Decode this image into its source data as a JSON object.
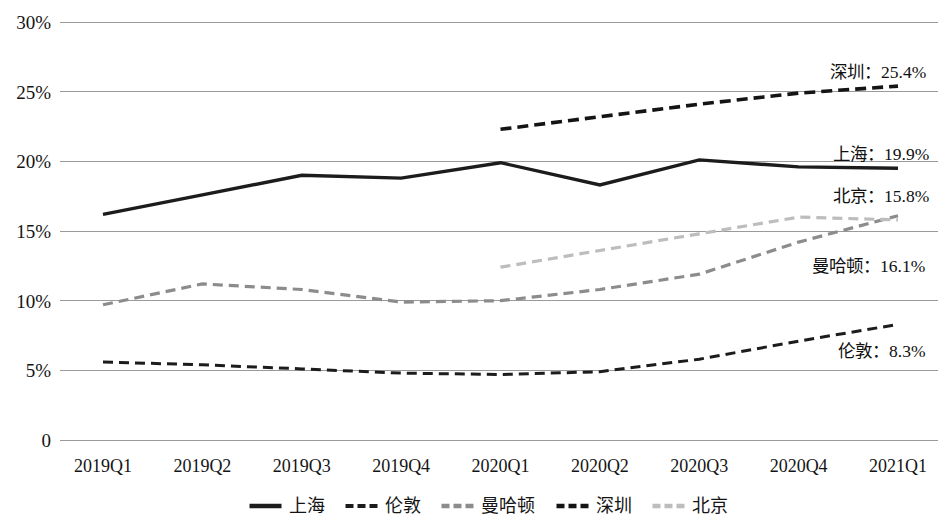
{
  "chart_data": {
    "type": "line",
    "title": "",
    "subtitle": "",
    "xlabel": "",
    "ylabel": "",
    "grid": true,
    "legend_position": "bottom",
    "ylim": [
      0,
      30
    ],
    "ytick_labels": [
      "30%",
      "25%",
      "20%",
      "15%",
      "10%",
      "5%",
      "0"
    ],
    "ytick_values": [
      30,
      25,
      20,
      15,
      10,
      5,
      0
    ],
    "categories": [
      "2019Q1",
      "2019Q2",
      "2019Q3",
      "2019Q4",
      "2020Q1",
      "2020Q2",
      "2020Q3",
      "2020Q4",
      "2021Q1"
    ],
    "series": [
      {
        "name": "上海",
        "legend_label": "上海",
        "style": "solid",
        "color": "#1c1c1c",
        "width": 3.4,
        "values": [
          16.2,
          17.6,
          19.0,
          18.8,
          19.9,
          18.3,
          20.1,
          19.6,
          19.5
        ],
        "annotation": "上海：19.9%",
        "annotation_value": "19.9%"
      },
      {
        "name": "伦敦",
        "legend_label": "伦敦",
        "style": "dashed",
        "color": "#1c1c1c",
        "width": 3.0,
        "values": [
          5.6,
          5.4,
          5.1,
          4.8,
          4.7,
          4.9,
          5.8,
          7.1,
          8.3
        ],
        "annotation": "伦敦：8.3%",
        "annotation_value": "8.3%"
      },
      {
        "name": "曼哈顿",
        "legend_label": "曼哈顿",
        "style": "dashed",
        "color": "#8c8c8c",
        "width": 3.2,
        "values": [
          9.7,
          11.2,
          10.8,
          9.9,
          10.0,
          10.8,
          11.9,
          14.2,
          16.1
        ],
        "annotation": "曼哈顿：16.1%",
        "annotation_value": "16.1%"
      },
      {
        "name": "深圳",
        "legend_label": "深圳",
        "style": "dashed",
        "color": "#141414",
        "width": 3.6,
        "values": [
          null,
          null,
          null,
          null,
          22.3,
          23.2,
          24.1,
          24.9,
          25.4
        ],
        "annotation": "深圳：25.4%",
        "annotation_value": "25.4%"
      },
      {
        "name": "北京",
        "legend_label": "北京",
        "style": "dashed",
        "color": "#bdbdbd",
        "width": 3.2,
        "values": [
          null,
          null,
          null,
          null,
          12.4,
          13.6,
          14.8,
          16.0,
          15.8
        ],
        "annotation": "北京：15.8%",
        "annotation_value": "15.8%"
      }
    ]
  },
  "axes": {
    "y_labels": [
      "30%",
      "25%",
      "20%",
      "15%",
      "10%",
      "5%",
      "0"
    ],
    "x_labels": [
      "2019Q1",
      "2019Q2",
      "2019Q3",
      "2019Q4",
      "2020Q1",
      "2020Q2",
      "2020Q3",
      "2020Q4",
      "2021Q1"
    ]
  },
  "annotations": [
    {
      "text": "深圳：25.4%"
    },
    {
      "text": "上海：19.9%"
    },
    {
      "text": "北京：15.8%"
    },
    {
      "text": "曼哈顿：16.1%"
    },
    {
      "text": "伦敦：8.3%"
    }
  ],
  "legend": {
    "items": [
      {
        "label": "上海"
      },
      {
        "label": "伦敦"
      },
      {
        "label": "曼哈顿"
      },
      {
        "label": "深圳"
      },
      {
        "label": "北京"
      }
    ]
  },
  "colors": {
    "gridline": "#9a9a9a",
    "background": "#ffffff",
    "text": "#141414",
    "shanghai": "#1c1c1c",
    "london": "#1c1c1c",
    "manhattan": "#8c8c8c",
    "shenzhen": "#141414",
    "beijing": "#bdbdbd"
  }
}
